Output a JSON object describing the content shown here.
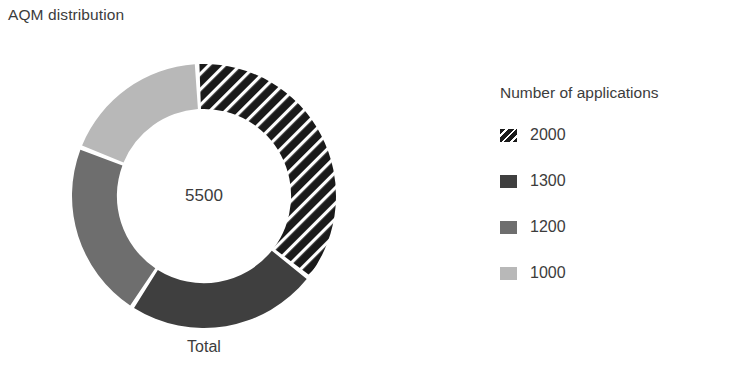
{
  "chart_title": "AQM distribution",
  "category_label": "Total",
  "center_value": "5500",
  "legend": {
    "title": "Number of applications",
    "items": [
      {
        "label": "2000",
        "color": "#1a1a1a",
        "pattern": "diagonal-stripes"
      },
      {
        "label": "1300",
        "color": "#3f3f3f",
        "pattern": "solid"
      },
      {
        "label": "1200",
        "color": "#6e6e6e",
        "pattern": "solid"
      },
      {
        "label": "1000",
        "color": "#b8b8b8",
        "pattern": "solid"
      }
    ]
  },
  "chart_data": {
    "type": "pie",
    "variant": "donut",
    "title": "AQM distribution",
    "categories": [
      "2000",
      "1300",
      "1200",
      "1000"
    ],
    "values": [
      2000,
      1300,
      1200,
      1000
    ],
    "total": 5500,
    "center_label": "5500",
    "axis_category": "Total",
    "legend_title": "Number of applications",
    "legend_position": "right",
    "grid": false,
    "series_colors": [
      "#1a1a1a",
      "#3f3f3f",
      "#6e6e6e",
      "#b8b8b8"
    ],
    "series_patterns": [
      "diagonal-stripes",
      "solid",
      "solid",
      "solid"
    ],
    "percentages": [
      36.4,
      23.6,
      21.8,
      18.2
    ],
    "start_angle_deg": -3,
    "direction": "clockwise",
    "inner_radius_ratio": 0.66
  }
}
